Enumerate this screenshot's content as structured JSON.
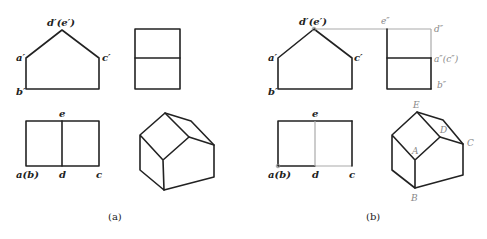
{
  "panel_a": {
    "caption": "(a)",
    "front_view": {
      "label_top": "d′(e′)",
      "label_left": "a′",
      "label_right": "c′",
      "label_bottom": "b′"
    },
    "top_view": {
      "label_top": "e",
      "label_left": "a(b)",
      "label_mid": "d",
      "label_right": "c"
    }
  },
  "panel_b": {
    "caption": "(b)",
    "front_view": {
      "label_top": "d′(e′)",
      "label_left": "a′",
      "label_right": "c′",
      "label_bottom": "b′"
    },
    "side_view": {
      "label_tl": "e″",
      "label_tr": "d″",
      "label_mid": "a″(c″)",
      "label_bottom": "b″"
    },
    "top_view": {
      "label_top": "e",
      "label_left": "a(b)",
      "label_mid": "d",
      "label_right": "c"
    },
    "iso_view": {
      "label_E": "E",
      "label_D": "D",
      "label_C": "C",
      "label_A": "A",
      "label_B": "B"
    }
  },
  "colors": {
    "line": "#222222",
    "construction": "#aaaaaa"
  }
}
